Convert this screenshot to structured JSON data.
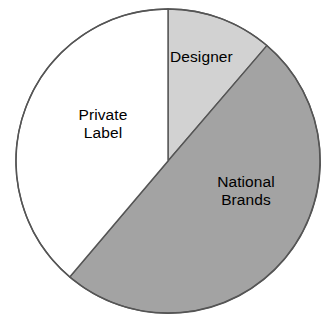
{
  "chart_data": {
    "type": "pie",
    "title": "",
    "subtitle": "",
    "xlabel": "",
    "ylabel": "",
    "legend_position": "none",
    "labels_position": "inside-slices",
    "grid": false,
    "start_angle_deg": 0,
    "direction": "clockwise",
    "categories": [
      "Designer",
      "National Brands",
      "Private Label"
    ],
    "values": [
      11.3,
      50.0,
      38.7
    ],
    "units": "percent",
    "slices": [
      {
        "label": "Designer",
        "value": 11.3,
        "angle_deg": 40.6,
        "color": "#d2d2d2",
        "start_deg": 0,
        "end_deg": 40.6,
        "label_text": "Designer"
      },
      {
        "label": "National Brands",
        "value": 50.0,
        "angle_deg": 179.7,
        "color": "#a3a3a3",
        "start_deg": 40.6,
        "end_deg": 220.3,
        "label_text": "National\nBrands"
      },
      {
        "label": "Private Label",
        "value": 38.7,
        "angle_deg": 139.7,
        "color": "#ffffff",
        "start_deg": 220.3,
        "end_deg": 360,
        "label_text": "Private\nLabel"
      }
    ],
    "stroke_color": "#555555",
    "background": "#ffffff",
    "geometry": {
      "center_x": 168,
      "center_y": 161,
      "radius": 152
    }
  }
}
